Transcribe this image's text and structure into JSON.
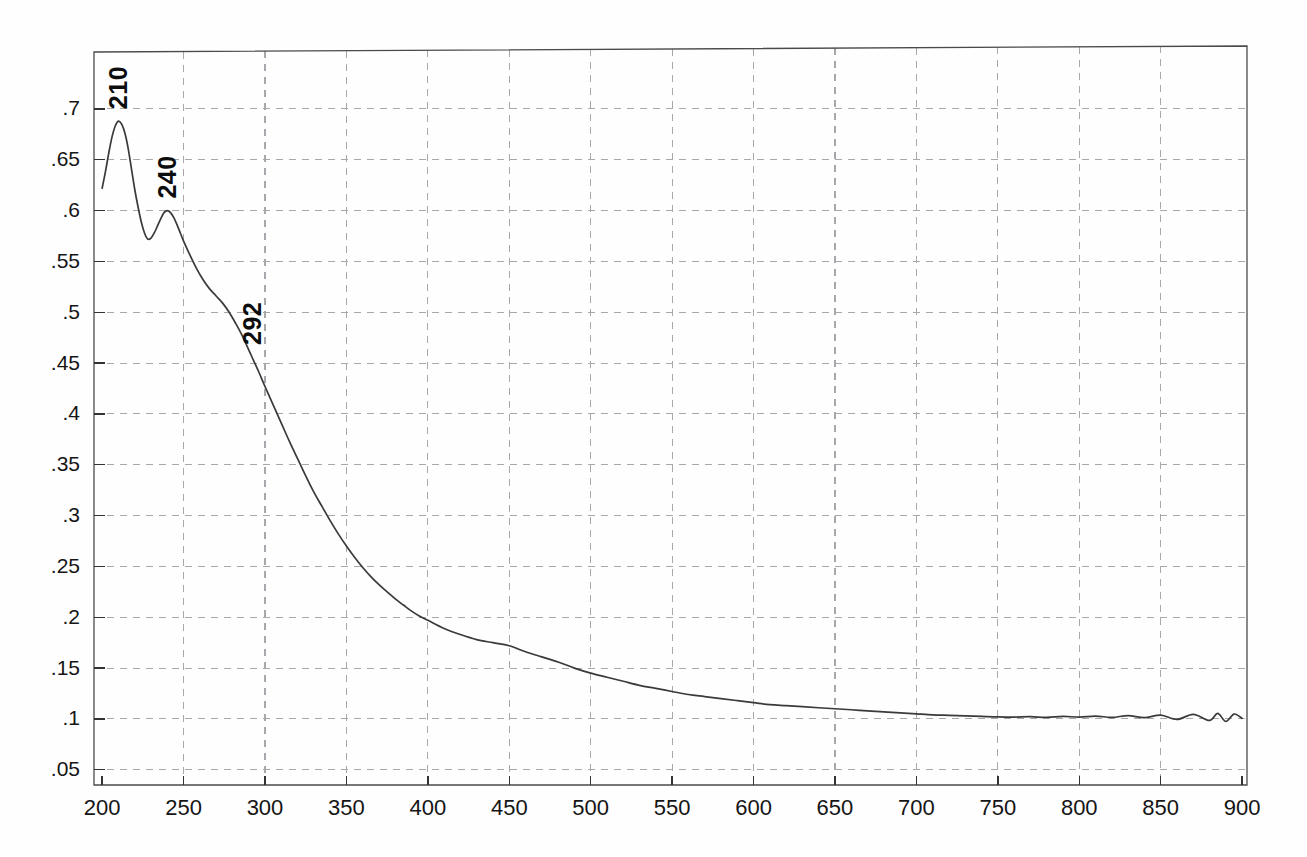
{
  "chart_data": {
    "type": "line",
    "title": "",
    "subtitle": "",
    "xlabel": "",
    "ylabel": "",
    "xlim": [
      195,
      903
    ],
    "ylim": [
      0.035,
      0.756
    ],
    "grid": true,
    "legend_position": "none",
    "x_ticks": [
      200,
      250,
      300,
      350,
      400,
      450,
      500,
      550,
      600,
      650,
      700,
      750,
      800,
      850,
      900
    ],
    "x_tick_labels": [
      "200",
      "250",
      "300",
      "350",
      "400",
      "450",
      "500",
      "550",
      "600",
      "650",
      "700",
      "750",
      "800",
      "850",
      "900"
    ],
    "y_ticks": [
      0.05,
      0.1,
      0.15,
      0.2,
      0.25,
      0.3,
      0.35,
      0.4,
      0.45,
      0.5,
      0.55,
      0.6,
      0.65,
      0.7
    ],
    "y_tick_labels": [
      ".05",
      ".1",
      ".15",
      ".2",
      ".25",
      ".3",
      ".35",
      ".4",
      ".45",
      ".5",
      ".55",
      ".6",
      ".65",
      ".7"
    ],
    "series": [
      {
        "name": "absorbance",
        "color": "#3a3a3a",
        "x": [
          200,
          202,
          204,
          206,
          208,
          210,
          212,
          214,
          216,
          218,
          220,
          222,
          224,
          226,
          228,
          230,
          232,
          234,
          236,
          238,
          240,
          242,
          244,
          246,
          248,
          250,
          254,
          258,
          262,
          266,
          270,
          274,
          278,
          282,
          286,
          290,
          292,
          296,
          300,
          305,
          310,
          315,
          320,
          325,
          330,
          335,
          340,
          345,
          350,
          355,
          360,
          365,
          370,
          375,
          380,
          385,
          390,
          395,
          400,
          410,
          420,
          430,
          440,
          450,
          460,
          470,
          480,
          490,
          500,
          510,
          520,
          530,
          540,
          550,
          560,
          570,
          580,
          590,
          600,
          610,
          620,
          630,
          640,
          650,
          660,
          670,
          680,
          690,
          700,
          710,
          720,
          730,
          740,
          750,
          760,
          770,
          780,
          790,
          800,
          810,
          820,
          830,
          840,
          850,
          860,
          870,
          880,
          885,
          890,
          895,
          900
        ],
        "y": [
          0.622,
          0.638,
          0.656,
          0.672,
          0.683,
          0.688,
          0.685,
          0.676,
          0.661,
          0.641,
          0.621,
          0.604,
          0.589,
          0.578,
          0.572,
          0.573,
          0.578,
          0.585,
          0.592,
          0.598,
          0.6,
          0.598,
          0.593,
          0.586,
          0.578,
          0.57,
          0.556,
          0.543,
          0.532,
          0.523,
          0.516,
          0.509,
          0.5,
          0.489,
          0.477,
          0.463,
          0.456,
          0.442,
          0.427,
          0.409,
          0.391,
          0.373,
          0.356,
          0.339,
          0.323,
          0.309,
          0.295,
          0.282,
          0.27,
          0.259,
          0.249,
          0.24,
          0.232,
          0.225,
          0.218,
          0.212,
          0.206,
          0.201,
          0.197,
          0.189,
          0.183,
          0.178,
          0.175,
          0.172,
          0.166,
          0.161,
          0.156,
          0.15,
          0.145,
          0.141,
          0.137,
          0.133,
          0.13,
          0.127,
          0.124,
          0.122,
          0.12,
          0.118,
          0.116,
          0.114,
          0.113,
          0.112,
          0.111,
          0.11,
          0.109,
          0.108,
          0.107,
          0.106,
          0.105,
          0.104,
          0.1035,
          0.103,
          0.1025,
          0.102,
          0.1018,
          0.1022,
          0.1015,
          0.1025,
          0.1018,
          0.1028,
          0.1015,
          0.1032,
          0.1012,
          0.1038,
          0.0995,
          0.1045,
          0.0985,
          0.1055,
          0.0975,
          0.1048,
          0.1005
        ]
      }
    ],
    "annotations": [
      {
        "label": "210",
        "x": 210,
        "y": 0.688,
        "orientation": "vertical"
      },
      {
        "label": "240",
        "x": 240,
        "y": 0.6,
        "orientation": "vertical"
      },
      {
        "label": "292",
        "x": 292,
        "y": 0.456,
        "orientation": "vertical"
      }
    ],
    "colors": {
      "curve": "#3a3a3a",
      "grid": "#a8a8ac",
      "frame": "#4a4a4a",
      "background": "#ffffff",
      "text": "#151515"
    }
  }
}
